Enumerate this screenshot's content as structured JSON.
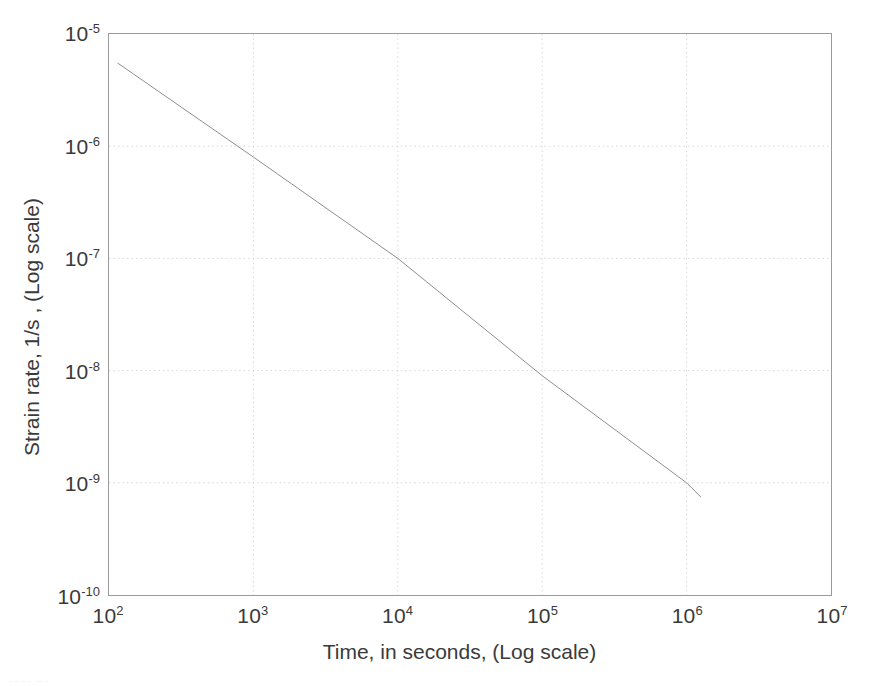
{
  "chart_data": {
    "type": "line",
    "title": "",
    "xlabel": "Time, in seconds, (Log scale)",
    "ylabel": "Strain rate, 1/s , (Log scale)",
    "xscale": "log",
    "yscale": "log",
    "xlim": [
      100,
      10000000
    ],
    "ylim": [
      1e-10,
      1e-05
    ],
    "grid": true,
    "grid_style": "dotted",
    "legend": "none",
    "xticks": [
      {
        "value": 100,
        "label": "10",
        "exponent": "2"
      },
      {
        "value": 1000,
        "label": "10",
        "exponent": "3"
      },
      {
        "value": 10000,
        "label": "10",
        "exponent": "4"
      },
      {
        "value": 100000,
        "label": "10",
        "exponent": "5"
      },
      {
        "value": 1000000,
        "label": "10",
        "exponent": "6"
      },
      {
        "value": 10000000,
        "label": "10",
        "exponent": "7"
      }
    ],
    "yticks": [
      {
        "value": 1e-05,
        "label": "10",
        "exponent": "-5"
      },
      {
        "value": 1e-06,
        "label": "10",
        "exponent": "-6"
      },
      {
        "value": 1e-07,
        "label": "10",
        "exponent": "-7"
      },
      {
        "value": 1e-08,
        "label": "10",
        "exponent": "-8"
      },
      {
        "value": 1e-09,
        "label": "10",
        "exponent": "-9"
      },
      {
        "value": 1e-10,
        "label": "10",
        "exponent": "-10"
      }
    ],
    "series": [
      {
        "name": "strain-rate-curve",
        "color": "#8e8e8e",
        "line_width": 1,
        "x": [
          115,
          1000,
          10000,
          100000,
          1000000,
          1250000
        ],
        "y": [
          5.5e-06,
          8e-07,
          1e-07,
          9e-09,
          1e-09,
          7.5e-10
        ]
      }
    ]
  },
  "axes": {
    "x_title": "Time, in seconds, (Log scale)",
    "y_title": "Strain rate, 1/s , (Log scale)",
    "frame_color": "#9a9a9a",
    "grid_color": "#d8d8d8",
    "text_color": "#3a3a3a"
  },
  "artifact": {
    "bottom_smudge": "- - -  - -- -"
  }
}
